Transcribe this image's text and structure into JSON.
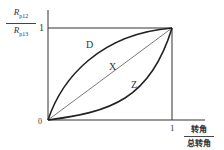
{
  "diagram": {
    "y_axis": {
      "numerator": "R",
      "numerator_sub": "p12",
      "denominator": "R",
      "denominator_sub": "p13",
      "tick_label": "1"
    },
    "x_axis": {
      "numerator": "转角",
      "denominator": "总转角",
      "tick_label": "1"
    },
    "origin_label": "0",
    "curves": [
      {
        "name": "D",
        "type": "concave"
      },
      {
        "name": "X",
        "type": "linear"
      },
      {
        "name": "Z",
        "type": "convex"
      }
    ],
    "colors": {
      "line": "#222222",
      "text": "#333333"
    }
  }
}
